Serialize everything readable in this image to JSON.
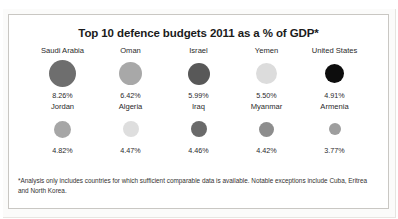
{
  "chart_data": {
    "type": "bar",
    "title": "Top 10 defence budgets 2011 as a % of GDP*",
    "xlabel": "",
    "ylabel": "% of GDP",
    "categories": [
      "Saudi Arabia",
      "Oman",
      "Israel",
      "Yemen",
      "United States",
      "Jordan",
      "Algeria",
      "Iraq",
      "Myanmar",
      "Armenia"
    ],
    "values": [
      8.26,
      6.42,
      5.99,
      5.5,
      4.91,
      4.82,
      4.47,
      4.46,
      4.42,
      3.77
    ],
    "value_labels": [
      "8.26%",
      "6.42%",
      "5.99%",
      "5.50%",
      "4.91%",
      "4.82%",
      "4.47%",
      "4.46%",
      "4.42%",
      "3.77%"
    ],
    "grid": false,
    "legend": "none",
    "note": "Bubble area scales with percentage; fill shade is categorical, not value-encoded."
  },
  "footnote": {
    "text": "*Analysis only includes countries for which sufficient comparable data is available. Notable exceptions include Cuba, Eritrea and North Korea."
  },
  "rows": [
    {
      "cells": [
        {
          "label": "Saudi Arabia",
          "value": "8.26%",
          "color": "#6e6e6e",
          "size": 27
        },
        {
          "label": "Oman",
          "value": "6.42%",
          "color": "#a8a8a8",
          "size": 23
        },
        {
          "label": "Israel",
          "value": "5.99%",
          "color": "#585858",
          "size": 22
        },
        {
          "label": "Yemen",
          "value": "5.50%",
          "color": "#dcdcdc",
          "size": 21
        },
        {
          "label": "United States",
          "value": "4.91%",
          "color": "#0d0d0d",
          "size": 19
        }
      ]
    },
    {
      "cells": [
        {
          "label": "Jordan",
          "value": "4.82%",
          "color": "#a6a6a6",
          "size": 17
        },
        {
          "label": "Algeria",
          "value": "4.47%",
          "color": "#dedede",
          "size": 16
        },
        {
          "label": "Iraq",
          "value": "4.46%",
          "color": "#6a6a6a",
          "size": 16
        },
        {
          "label": "Myanmar",
          "value": "4.42%",
          "color": "#8d8d8d",
          "size": 15
        },
        {
          "label": "Armenia",
          "value": "3.77%",
          "color": "#9e9e9e",
          "size": 12
        }
      ]
    }
  ]
}
